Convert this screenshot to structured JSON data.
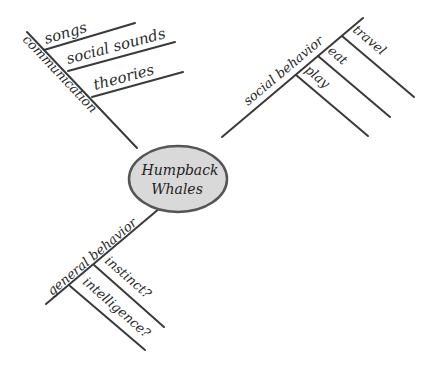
{
  "diagram": {
    "type": "mind-map",
    "center": {
      "line1": "Humpback",
      "line2": "Whales",
      "fill": "#d9d9d9",
      "stroke": "#555555"
    },
    "branches": [
      {
        "label": "communication",
        "children": [
          "songs",
          "social sounds",
          "theories"
        ]
      },
      {
        "label": "social behavior",
        "children": [
          "travel",
          "eat",
          "play"
        ]
      },
      {
        "label": "general behavior",
        "children": [
          "instinct?",
          "intelligence?"
        ]
      }
    ]
  }
}
